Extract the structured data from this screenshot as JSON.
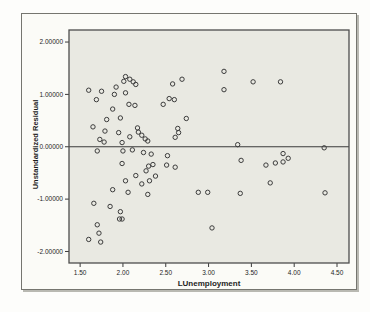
{
  "style": {
    "page_bg": "#fdfdfb",
    "figure_bg": "#fbfbf7",
    "plot_bg": "#e9e9e2",
    "frame_color": "#4d4d4d",
    "outer_border_color": "#75756f",
    "point_color": "#3c3c3c",
    "ref_line_color": "#3a3a3a",
    "tick_color": "#3a3a3a",
    "text_color": "#1e1e1e"
  },
  "chart_data": {
    "type": "scatter",
    "title": "",
    "xlabel": "LUnemployment",
    "ylabel": "Unstandardized Residual",
    "xlim": [
      1.37,
      4.64
    ],
    "ylim": [
      -2.22,
      2.23
    ],
    "grid": false,
    "legend": false,
    "marker": "open-circle",
    "reference_line_y": 0.0,
    "x_ticks": {
      "values": [
        1.5,
        2.0,
        2.5,
        3.0,
        3.5,
        4.0,
        4.5
      ],
      "labels": [
        "1.50",
        "2.00",
        "2.50",
        "3.00",
        "3.50",
        "4.00",
        "4.50"
      ]
    },
    "y_ticks": {
      "values": [
        2,
        1,
        0,
        -1,
        -2
      ],
      "labels": [
        "2.00000",
        "1.00000",
        "0.00000",
        "-1.00000",
        "-2.00000"
      ]
    },
    "points": [
      [
        1.6,
        1.08
      ],
      [
        1.75,
        1.06
      ],
      [
        1.69,
        0.9
      ],
      [
        1.9,
        1.0
      ],
      [
        2.03,
        1.03
      ],
      [
        1.92,
        1.14
      ],
      [
        2.01,
        1.25
      ],
      [
        2.03,
        1.34
      ],
      [
        2.08,
        1.29
      ],
      [
        2.12,
        1.24
      ],
      [
        2.15,
        1.19
      ],
      [
        2.07,
        0.81
      ],
      [
        2.14,
        0.79
      ],
      [
        1.88,
        0.72
      ],
      [
        1.97,
        0.55
      ],
      [
        1.81,
        0.52
      ],
      [
        2.47,
        0.81
      ],
      [
        2.54,
        0.92
      ],
      [
        2.6,
        0.9
      ],
      [
        2.58,
        1.2
      ],
      [
        2.69,
        1.29
      ],
      [
        2.74,
        0.54
      ],
      [
        1.65,
        0.38
      ],
      [
        1.79,
        0.3
      ],
      [
        1.95,
        0.27
      ],
      [
        1.73,
        0.14
      ],
      [
        1.78,
        0.09
      ],
      [
        1.99,
        0.08
      ],
      [
        2.17,
        0.36
      ],
      [
        2.18,
        0.28
      ],
      [
        2.08,
        0.19
      ],
      [
        2.22,
        0.22
      ],
      [
        2.26,
        0.15
      ],
      [
        2.29,
        0.11
      ],
      [
        2.64,
        0.35
      ],
      [
        2.65,
        0.27
      ],
      [
        2.61,
        0.18
      ],
      [
        3.18,
        1.44
      ],
      [
        3.18,
        1.09
      ],
      [
        3.52,
        1.24
      ],
      [
        3.84,
        1.24
      ],
      [
        3.34,
        0.04
      ],
      [
        4.35,
        -0.02
      ],
      [
        1.7,
        -0.08
      ],
      [
        2.0,
        -0.08
      ],
      [
        2.11,
        -0.06
      ],
      [
        2.24,
        -0.11
      ],
      [
        2.33,
        -0.14
      ],
      [
        2.52,
        -0.17
      ],
      [
        1.99,
        -0.32
      ],
      [
        2.51,
        -0.35
      ],
      [
        2.61,
        -0.39
      ],
      [
        2.3,
        -0.37
      ],
      [
        2.35,
        -0.34
      ],
      [
        2.15,
        -0.55
      ],
      [
        2.27,
        -0.46
      ],
      [
        2.38,
        -0.56
      ],
      [
        2.31,
        -0.65
      ],
      [
        2.22,
        -0.71
      ],
      [
        2.03,
        -0.65
      ],
      [
        1.88,
        -0.82
      ],
      [
        2.06,
        -0.87
      ],
      [
        2.29,
        -0.91
      ],
      [
        2.88,
        -0.87
      ],
      [
        2.99,
        -0.87
      ],
      [
        1.66,
        -1.08
      ],
      [
        1.85,
        -1.14
      ],
      [
        1.97,
        -1.24
      ],
      [
        1.96,
        -1.38
      ],
      [
        1.99,
        -1.38
      ],
      [
        1.7,
        -1.49
      ],
      [
        1.72,
        -1.65
      ],
      [
        1.6,
        -1.77
      ],
      [
        1.74,
        -1.82
      ],
      [
        3.38,
        -0.26
      ],
      [
        3.67,
        -0.35
      ],
      [
        3.78,
        -0.31
      ],
      [
        3.87,
        -0.29
      ],
      [
        3.87,
        -0.13
      ],
      [
        3.93,
        -0.22
      ],
      [
        3.72,
        -0.69
      ],
      [
        3.37,
        -0.89
      ],
      [
        4.36,
        -0.88
      ],
      [
        3.04,
        -1.55
      ]
    ]
  }
}
